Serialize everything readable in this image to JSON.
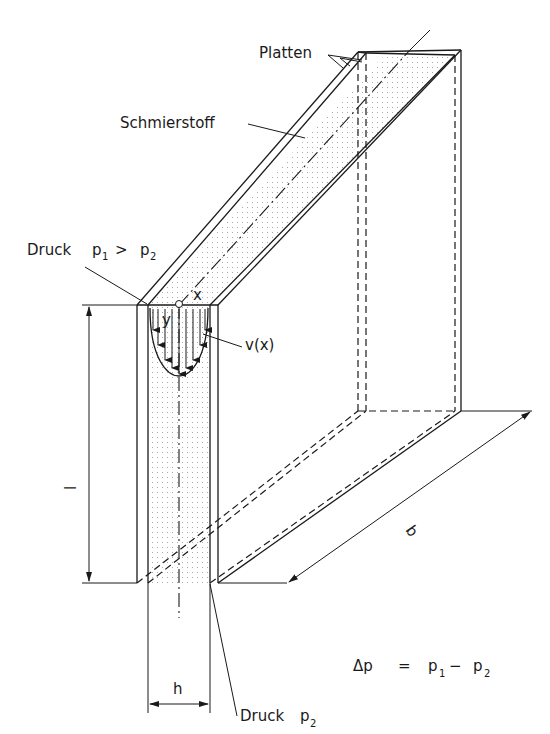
{
  "labels": {
    "plates": "Platten",
    "lubricant": "Schmierstoff",
    "pressure_inlet_word": "Druck",
    "pressure_inlet_p": "p",
    "pressure_inlet_sub1": "1",
    "pressure_inlet_gt": ">",
    "pressure_inlet_p2": "p",
    "pressure_inlet_sub2": "2",
    "velocity_profile": "v(x)",
    "axis_x": "x",
    "axis_y": "y",
    "length": "l",
    "width": "b",
    "gap": "h",
    "pressure_outlet_word": "Druck",
    "pressure_outlet_p": "p",
    "pressure_outlet_sub": "2",
    "formula_delta": "Δp",
    "formula_eq": "=",
    "formula_p1": "p",
    "formula_sub1": "1",
    "formula_minus": "−",
    "formula_p2": "p",
    "formula_sub2": "2"
  },
  "colors": {
    "ink": "#1a1a1a",
    "fill_dots": "#b0b0b0",
    "background": "#ffffff"
  }
}
